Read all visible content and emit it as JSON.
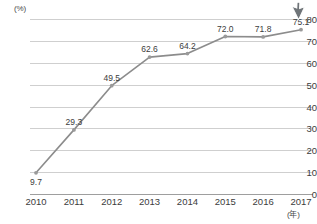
{
  "chart_data": {
    "type": "line",
    "title": "",
    "subtitle": "",
    "xlabel": "(年)",
    "ylabel": "(%)",
    "categories": [
      "2010",
      "2011",
      "2012",
      "2013",
      "2014",
      "2015",
      "2016",
      "2017"
    ],
    "values": [
      9.7,
      29.3,
      49.5,
      62.6,
      64.2,
      72.0,
      71.8,
      75.1
    ],
    "point_labels": [
      "9.7",
      "29.3",
      "49.5",
      "62.6",
      "64.2",
      "72.0",
      "71.8",
      "75.1"
    ],
    "label_positions": [
      "below",
      "above",
      "above",
      "above",
      "above",
      "above",
      "above",
      "above"
    ],
    "ylim": [
      0,
      80
    ],
    "ytick_values": [
      0,
      10,
      20,
      30,
      40,
      50,
      60,
      70,
      80
    ],
    "ytick_labels": [
      "0",
      "10",
      "20",
      "30",
      "40",
      "50",
      "60",
      "70",
      "80"
    ],
    "grid": true,
    "grid_axis": "y",
    "legend": false,
    "legend_position": "none",
    "series": [
      {
        "name": "",
        "values": [
          9.7,
          29.3,
          49.5,
          62.6,
          64.2,
          72.0,
          71.8,
          75.1
        ],
        "color": "#8c8c8c",
        "marker": "circle"
      }
    ]
  },
  "colors": {
    "line": "#8c8c8c",
    "marker_fill": "#9a9a9a",
    "gridline": "#cfcfcf",
    "baseline": "#9e9e9e",
    "text": "#3c3c3c",
    "background": "#ffffff"
  },
  "cursor": {
    "name": "mouse-pointer",
    "visible": true
  }
}
